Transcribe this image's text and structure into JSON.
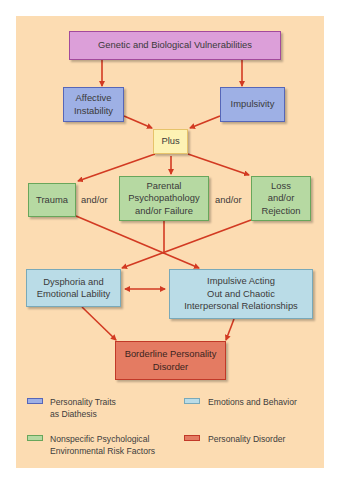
{
  "diagram": {
    "nodes": {
      "genetic": "Genetic and Biological Vulnerabilities",
      "affective": "Affective\nInstability",
      "impulsivity": "Impulsivity",
      "plus": "Plus",
      "trauma": "Trauma",
      "parental": "Parental\nPsychopathology\nand/or Failure",
      "loss": "Loss\nand/or\nRejection",
      "dysphoria": "Dysphoria and\nEmotional Lability",
      "impulsive_acting": "Impulsive Acting\nOut and Chaotic\nInterpersonal Relationships",
      "borderline": "Borderline Personality\nDisorder"
    },
    "connectors": {
      "andor_1": "and/or",
      "andor_2": "and/or"
    },
    "edges": [
      {
        "from": "genetic",
        "to": "affective"
      },
      {
        "from": "genetic",
        "to": "impulsivity"
      },
      {
        "from": "affective",
        "to": "plus"
      },
      {
        "from": "impulsivity",
        "to": "plus"
      },
      {
        "from": "plus",
        "to": "trauma"
      },
      {
        "from": "plus",
        "to": "parental"
      },
      {
        "from": "plus",
        "to": "loss"
      },
      {
        "from": "trauma",
        "to": "impulsive_acting"
      },
      {
        "from": "parental",
        "to": "dysphoria"
      },
      {
        "from": "loss",
        "to": "dysphoria"
      },
      {
        "from": "dysphoria",
        "to": "impulsive_acting",
        "bidirectional": true
      },
      {
        "from": "dysphoria",
        "to": "borderline"
      },
      {
        "from": "impulsive_acting",
        "to": "borderline"
      }
    ]
  },
  "legend": {
    "items": [
      {
        "label": "Personality Traits\nas Diathesis",
        "color": "#9eb0e5"
      },
      {
        "label": "Emotions and Behavior",
        "color": "#badce7"
      },
      {
        "label": "Nonspecific Psychological\nEnvironmental Risk Factors",
        "color": "#b6d9a2"
      },
      {
        "label": "Personality Disorder",
        "color": "#e47b62"
      }
    ]
  },
  "colors": {
    "background_panel": "#fcdcb2",
    "arrow": "#d23a22",
    "genetic": "#dc9fd9",
    "traits": "#9eb0e5",
    "plus": "#fdf2b4",
    "risk_factors": "#b6d9a2",
    "emotions_behavior": "#badce7",
    "disorder": "#e47b62"
  }
}
